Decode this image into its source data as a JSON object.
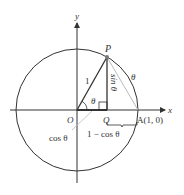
{
  "figure": {
    "axis_x_label": "x",
    "axis_y_label": "y",
    "origin_label": "O",
    "point_p_label": "P",
    "point_q_label": "Q",
    "point_a_label": "A(1, 0)",
    "radius_label": "1",
    "angle_label": "θ",
    "arc_label": "θ",
    "sin_label": "sin θ",
    "cos_label": "cos θ",
    "one_minus_cos_label": "1 − cos θ",
    "colors": {
      "stroke": "#333333",
      "chord": "#bbbbbb",
      "point": "#777777"
    }
  }
}
